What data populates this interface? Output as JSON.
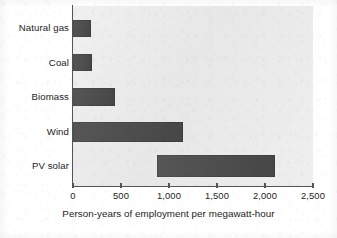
{
  "chart_data": {
    "type": "bar",
    "orientation": "horizontal",
    "title": "",
    "subtitle": "",
    "xlabel": "Person-years of employment per megawatt-hour",
    "ylabel": "",
    "categories": [
      "Natural gas",
      "Coal",
      "Biomass",
      "Wind",
      "PV solar"
    ],
    "values": [
      190,
      200,
      440,
      1150,
      2100
    ],
    "ranges": [
      {
        "category": "Natural gas",
        "start": 0,
        "end": 190
      },
      {
        "category": "Coal",
        "start": 0,
        "end": 200
      },
      {
        "category": "Biomass",
        "start": 0,
        "end": 440
      },
      {
        "category": "Wind",
        "start": 0,
        "end": 1150
      },
      {
        "category": "PV solar",
        "start": 870,
        "end": 2100
      }
    ],
    "xlim": [
      0,
      2500
    ],
    "xticks": [
      0,
      500,
      1000,
      1500,
      2000,
      2500
    ],
    "xtick_labels": [
      "0",
      "500",
      "1,000",
      "1,500",
      "2,000",
      "2,500"
    ],
    "grid": false,
    "legend": null,
    "bar_color": "#4a4a4a",
    "plot_background": "#eaeaea",
    "figure_background": "#ffffff",
    "axis_color": "#555555",
    "annotations": []
  },
  "axis": {
    "x_title": "Person-years of employment per megawatt-hour",
    "tick_labels": [
      "0",
      "500",
      "1,000",
      "1,500",
      "2,000",
      "2,500"
    ]
  },
  "categories": [
    {
      "label": "Natural gas"
    },
    {
      "label": "Coal"
    },
    {
      "label": "Biomass"
    },
    {
      "label": "Wind"
    },
    {
      "label": "PV solar"
    }
  ]
}
